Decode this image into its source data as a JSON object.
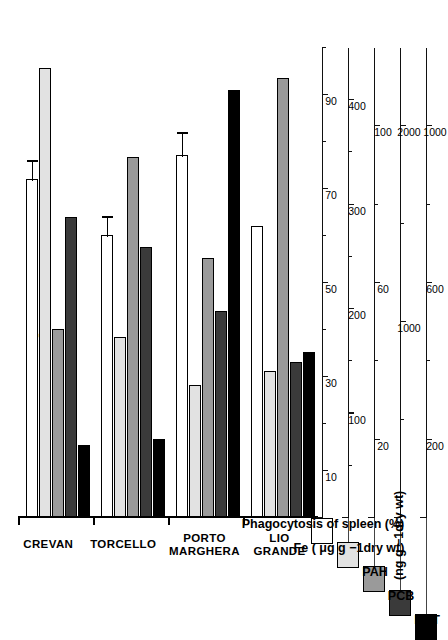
{
  "figure": {
    "month_label": "June",
    "site_labels": [
      "CREVAN",
      "TORCELLO",
      "PORTO\nMARGHERA",
      "LIO\nGRANDE"
    ]
  },
  "legend": {
    "items": [
      {
        "key": "phago",
        "label": "Phagocytosis of spleen (%)",
        "color": "#ffffff"
      },
      {
        "key": "fe",
        "label": "Fe ( μg g −1dry wt)",
        "color": "#e2e2e2"
      },
      {
        "key": "pah",
        "label": "PAH",
        "color": "#9a9a9a"
      },
      {
        "key": "pcb",
        "label": "PCB",
        "color": "#3a3a3a"
      },
      {
        "key": "ddt",
        "label": "DDT",
        "color": "#000000"
      }
    ],
    "units_note": "(ng g −1dry wt)"
  },
  "axes": [
    {
      "key": "phago",
      "name": "phagocytosis-axis",
      "max": 100,
      "ticks": [
        10,
        30,
        50,
        70,
        90
      ],
      "minor": [
        20,
        40,
        60,
        80,
        100
      ],
      "labels": [
        "10",
        "30",
        "50",
        "70",
        "90"
      ]
    },
    {
      "key": "fe",
      "name": "fe-axis",
      "max": 450,
      "ticks": [
        100,
        200,
        300,
        400
      ],
      "minor": [
        50,
        150,
        250,
        350
      ],
      "labels": [
        "100",
        "200",
        "300",
        "400"
      ]
    },
    {
      "key": "pah",
      "name": "pah-axis",
      "max": 120,
      "ticks": [
        20,
        60,
        100
      ],
      "minor": [
        40,
        80
      ],
      "labels": [
        "20",
        "60",
        "100"
      ]
    },
    {
      "key": "pcb",
      "name": "pcb-axis",
      "max": 2400,
      "ticks": [
        1000,
        2000
      ],
      "minor": [
        500,
        1500
      ],
      "labels": [
        "1000",
        "2000"
      ]
    },
    {
      "key": "ddt",
      "name": "ddt-axis",
      "max": 1200,
      "ticks": [
        200,
        600,
        1000
      ],
      "minor": [
        400,
        800
      ],
      "labels": [
        "200",
        "600",
        "1000"
      ]
    }
  ],
  "chart_data": {
    "type": "bar",
    "title": "June",
    "orientation": "horizontal",
    "categories": [
      "CREVAN",
      "TORCELLO",
      "PORTO MARGHERA",
      "LIO GRANDE"
    ],
    "series": [
      {
        "name": "Phagocytosis of spleen (%)",
        "key": "phago",
        "unit": "%",
        "color": "#ffffff",
        "values": [
          72,
          60,
          77,
          62
        ],
        "errors": [
          4,
          4,
          5,
          0
        ]
      },
      {
        "name": "Fe",
        "key": "fe",
        "unit": "μg g−1 dry wt",
        "color": "#e2e2e2",
        "values": [
          430,
          172,
          126,
          140
        ]
      },
      {
        "name": "PAH",
        "key": "pah",
        "unit": "ng g−1 dry wt",
        "color": "#9a9a9a",
        "values": [
          48,
          92,
          66,
          112
        ]
      },
      {
        "name": "PCB",
        "key": "pcb",
        "unit": "ng g−1 dry wt",
        "color": "#3a3a3a",
        "values": [
          1530,
          1380,
          1050,
          790
        ]
      },
      {
        "name": "DDT",
        "key": "ddt",
        "unit": "ng g−1 dry wt",
        "color": "#000000",
        "values": [
          185,
          200,
          1090,
          420
        ]
      }
    ],
    "xlabel": "",
    "ylabel": "",
    "grid": false,
    "legend_position": "left"
  }
}
